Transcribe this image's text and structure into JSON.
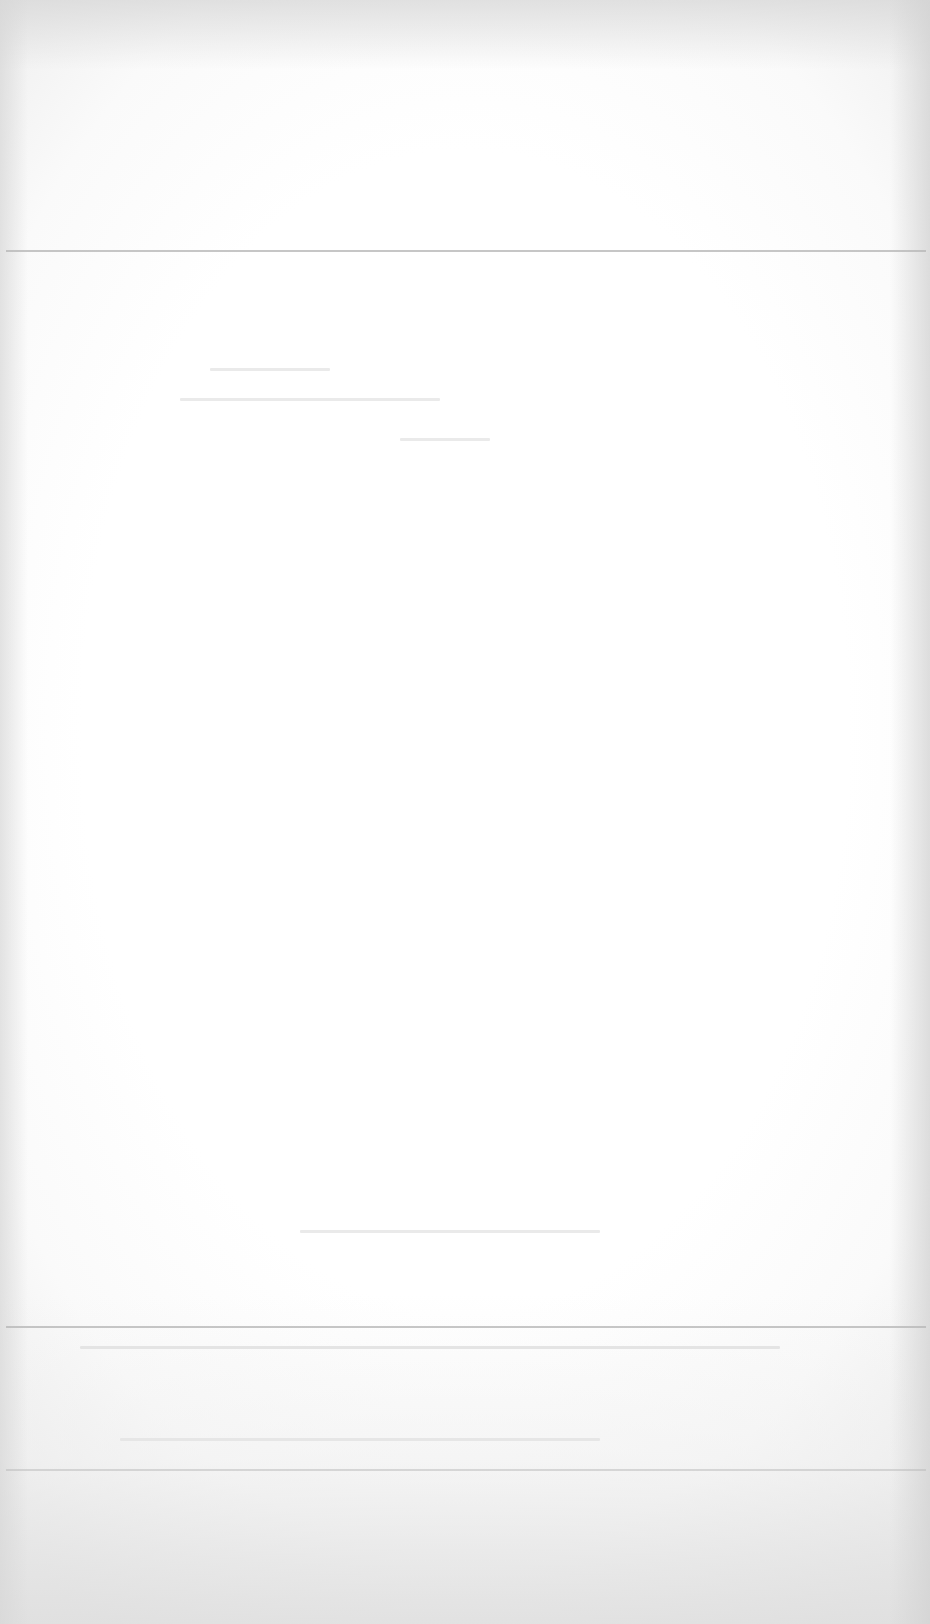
{
  "page": {
    "type": "blank-scanned-page",
    "legible_text": [],
    "background_color": "#ffffff",
    "edge_shading_color": "#e0e0e0",
    "rule_color": "#b8b8b8",
    "rules": [
      {
        "name": "rule-top",
        "y": 250
      },
      {
        "name": "rule-lower",
        "y": 1326
      },
      {
        "name": "rule-bottom",
        "y": 1469
      }
    ]
  }
}
